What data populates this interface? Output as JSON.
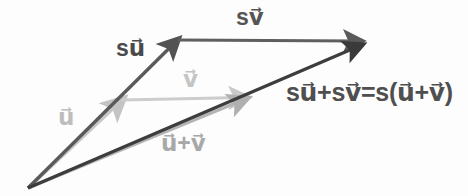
{
  "figure": {
    "background_color": "#fdfdfd",
    "width": 468,
    "height": 196,
    "labels": {
      "su": "su⃗",
      "sv": "sv⃗",
      "u": "u⃗",
      "v": "v⃗",
      "u_plus_v": "u⃗+v⃗",
      "equation": "su⃗+sv⃗=s(u⃗+v⃗)"
    },
    "colors": {
      "dark_vector": "#555555",
      "darkest_vector": "#3d3d3d",
      "light_vector": "#c8c8c8",
      "mid_light_vector": "#b4b4b4",
      "label_dark": "#4a4a4a",
      "label_light": "#bdbdbd"
    },
    "vectors": [
      {
        "name": "u",
        "label": "u⃗",
        "from": [
          28,
          188
        ],
        "to": [
          122,
          100
        ],
        "color": "#c8c8c8",
        "weight": "light"
      },
      {
        "name": "v",
        "label": "v⃗",
        "from": [
          122,
          100
        ],
        "to": [
          245,
          97
        ],
        "color": "#cccccc",
        "weight": "light"
      },
      {
        "name": "u-plus-v",
        "label": "u⃗+v⃗",
        "from": [
          28,
          188
        ],
        "to": [
          246,
          99
        ],
        "color": "#b4b4b4",
        "weight": "light"
      },
      {
        "name": "su",
        "label": "su⃗",
        "from": [
          28,
          188
        ],
        "to": [
          177,
          40
        ],
        "color": "#5a5a5a",
        "weight": "dark"
      },
      {
        "name": "sv",
        "label": "sv⃗",
        "from": [
          177,
          40
        ],
        "to": [
          360,
          41
        ],
        "color": "#5f5f5f",
        "weight": "dark"
      },
      {
        "name": "su-plus-sv",
        "label": "su⃗+sv⃗=s(u⃗+v⃗)",
        "from": [
          28,
          188
        ],
        "to": [
          361,
          45
        ],
        "color": "#3d3d3d",
        "weight": "dark"
      }
    ]
  }
}
